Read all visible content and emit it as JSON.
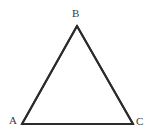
{
  "figure": {
    "kind": "geometry-figure",
    "shape": "triangle",
    "canvas": {
      "width": 154,
      "height": 138,
      "background": "#ffffff"
    },
    "stroke": {
      "color": "#2b2b2b",
      "width": 2
    },
    "label_color": "#3a3a3a",
    "vertices": [
      {
        "name": "B",
        "label": "B",
        "x": 77,
        "y": 26,
        "label_x": 72,
        "label_y": 8
      },
      {
        "name": "A",
        "label": "A",
        "x": 22,
        "y": 124,
        "label_x": 9,
        "label_y": 115
      },
      {
        "name": "C",
        "label": "C",
        "x": 133,
        "y": 124,
        "label_x": 136,
        "label_y": 116
      }
    ],
    "edges": [
      {
        "name": "edge-AB",
        "from": "A",
        "to": "B"
      },
      {
        "name": "edge-BC",
        "from": "B",
        "to": "C"
      },
      {
        "name": "edge-CA",
        "from": "C",
        "to": "A"
      }
    ],
    "path": "M 22 124 L 77 26 L 133 124 Z"
  }
}
